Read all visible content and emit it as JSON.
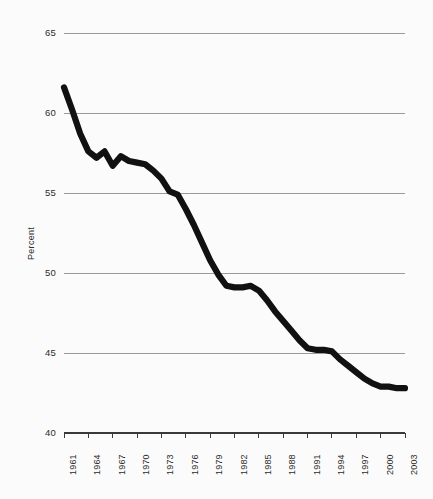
{
  "chart_data": {
    "type": "line",
    "title": "",
    "subtitle": "",
    "xlabel": "",
    "ylabel": "Percent",
    "ylim": [
      40,
      65
    ],
    "yticks": [
      40,
      45,
      50,
      55,
      60,
      65
    ],
    "xlim": [
      1961,
      2003
    ],
    "xticks": [
      1961,
      1964,
      1967,
      1970,
      1973,
      1976,
      1979,
      1982,
      1985,
      1988,
      1991,
      1994,
      1997,
      2000,
      2003
    ],
    "grid": "horizontal",
    "legend": "none",
    "series_color": "#111111",
    "grid_color": "#9a9a9a",
    "background_color": "#fbfbfb",
    "series": [
      {
        "name": "Percent",
        "x": [
          1961,
          1962,
          1963,
          1964,
          1965,
          1966,
          1967,
          1968,
          1969,
          1970,
          1971,
          1972,
          1973,
          1974,
          1975,
          1976,
          1977,
          1978,
          1979,
          1980,
          1981,
          1982,
          1983,
          1984,
          1985,
          1986,
          1987,
          1988,
          1989,
          1990,
          1991,
          1992,
          1993,
          1994,
          1995,
          1996,
          1997,
          1998,
          1999,
          2000,
          2001,
          2002,
          2003
        ],
        "values": [
          61.6,
          60.2,
          58.7,
          57.6,
          57.2,
          57.6,
          56.7,
          57.3,
          57.0,
          56.9,
          56.8,
          56.4,
          55.9,
          55.1,
          54.9,
          54.0,
          53.0,
          51.9,
          50.8,
          49.9,
          49.2,
          49.1,
          49.1,
          49.2,
          48.9,
          48.3,
          47.6,
          47.0,
          46.4,
          45.8,
          45.3,
          45.2,
          45.2,
          45.1,
          44.6,
          44.2,
          43.8,
          43.4,
          43.1,
          42.9,
          42.9,
          42.8,
          42.8
        ]
      }
    ]
  },
  "yaxis": {
    "ticks": [
      "65",
      "60",
      "55",
      "50",
      "45",
      "40"
    ],
    "title": "Percent"
  },
  "xaxis": {
    "ticks": [
      "1961",
      "1964",
      "1967",
      "1970",
      "1973",
      "1976",
      "1979",
      "1982",
      "1985",
      "1988",
      "1991",
      "1994",
      "1997",
      "2000",
      "2003"
    ]
  }
}
